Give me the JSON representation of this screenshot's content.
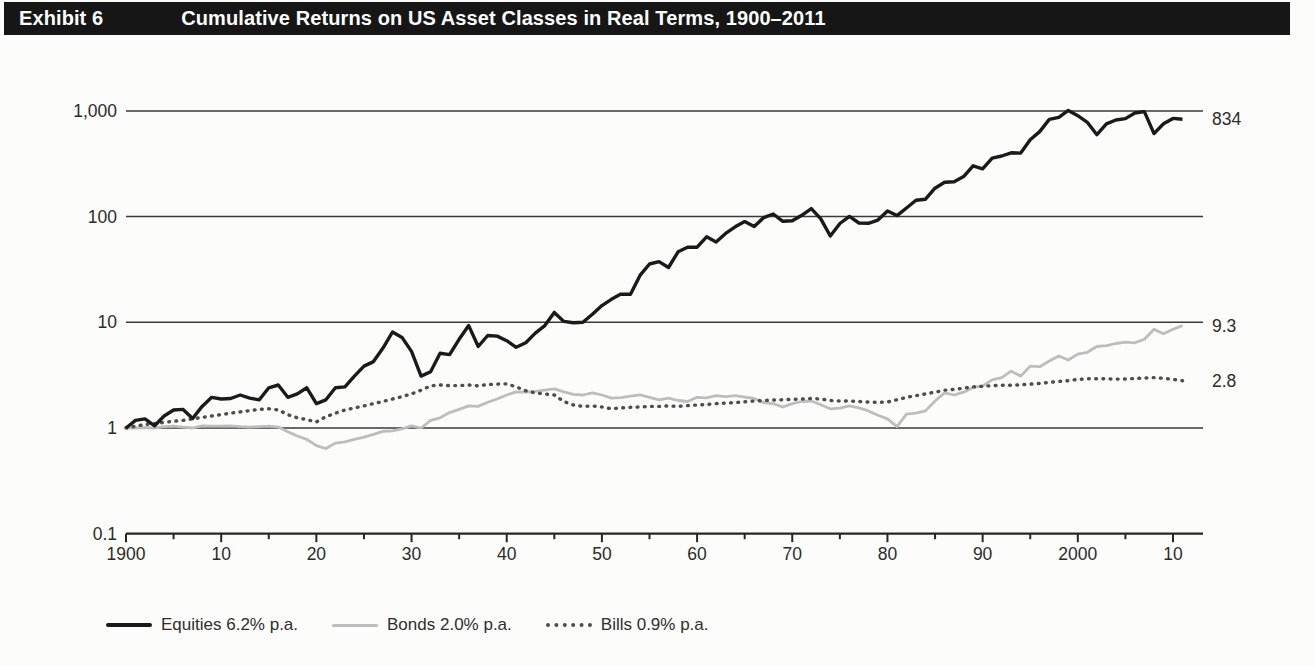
{
  "title_bar": {
    "exhibit": "Exhibit 6",
    "title": "Cumulative Returns on US Asset Classes in Real Terms, 1900–2011"
  },
  "legend": {
    "items": [
      {
        "label": "Equities  6.2% p.a.",
        "swatch": "thick-black-solid-line"
      },
      {
        "label": "Bonds 2.0% p.a.",
        "swatch": "light-gray-solid-line"
      },
      {
        "label": "Bills 0.9% p.a.",
        "swatch": "dark-gray-dotted-line"
      }
    ]
  },
  "chart_data": {
    "type": "line",
    "title": "Cumulative Returns on US Asset Classes in Real Terms, 1900–2011",
    "y_scale": "log",
    "xlim": [
      1900,
      2011
    ],
    "ylim": [
      0.1,
      1000
    ],
    "grid": "horizontal-only",
    "legend_position": "bottom-left",
    "x_start_year": 1900,
    "x_tick_years": [
      1900,
      1910,
      1920,
      1930,
      1940,
      1950,
      1960,
      1970,
      1980,
      1990,
      2000,
      2010
    ],
    "x_tick_labels": [
      "1900",
      "10",
      "20",
      "30",
      "40",
      "50",
      "60",
      "70",
      "80",
      "90",
      "2000",
      "10"
    ],
    "x_minor_tick_step": 5,
    "y_tick_values": [
      0.1,
      1,
      10,
      100,
      1000
    ],
    "y_tick_labels": [
      "0.1",
      "1",
      "10",
      "100",
      "1,000"
    ],
    "gridline_values": [
      1,
      10,
      100,
      1000
    ],
    "series": [
      {
        "name": "Equities",
        "label": "Equities  6.2% p.a.",
        "annual_return": "6.2% p.a.",
        "end_label": "834",
        "end_value": 834,
        "color": "#1a1a1a",
        "style": "solid-thick",
        "values": [
          1.0,
          1.18,
          1.22,
          1.05,
          1.3,
          1.48,
          1.5,
          1.23,
          1.6,
          1.95,
          1.88,
          1.9,
          2.05,
          1.92,
          1.85,
          2.4,
          2.55,
          1.95,
          2.1,
          2.4,
          1.7,
          1.85,
          2.4,
          2.45,
          3.1,
          3.85,
          4.25,
          5.7,
          8.1,
          7.2,
          5.3,
          3.1,
          3.4,
          5.1,
          4.95,
          6.9,
          9.3,
          5.9,
          7.5,
          7.4,
          6.7,
          5.8,
          6.4,
          7.9,
          9.3,
          12.4,
          10.2,
          9.9,
          10.0,
          11.9,
          14.4,
          16.5,
          18.5,
          18.4,
          27.8,
          35.6,
          37.5,
          33.0,
          46.4,
          51.2,
          51.4,
          64.4,
          57.6,
          69.4,
          80.1,
          89.6,
          80.5,
          97.8,
          105.8,
          90.2,
          91.3,
          102.8,
          119.0,
          95.1,
          65.5,
          86.1,
          100.4,
          86.9,
          86.5,
          92.6,
          113.2,
          102.1,
          120.7,
          142.6,
          146.2,
          185.6,
          211.1,
          213.7,
          239.2,
          302.7,
          283.1,
          357.9,
          374.5,
          401.7,
          399.1,
          533.9,
          637.7,
          830.6,
          870.0,
          1010.0,
          900.0,
          780.0,
          595.0,
          755.0,
          820.0,
          845.0,
          955.0,
          985.0,
          610.0,
          755.0,
          850.0,
          834.0
        ]
      },
      {
        "name": "Bonds",
        "label": "Bonds 2.0% p.a.",
        "annual_return": "2.0% p.a.",
        "end_label": "9.3",
        "end_value": 9.3,
        "color": "#bdbdbd",
        "style": "solid",
        "values": [
          1.0,
          1.0,
          1.01,
          1.0,
          1.03,
          1.04,
          1.02,
          1.0,
          1.05,
          1.04,
          1.04,
          1.05,
          1.03,
          1.02,
          1.03,
          1.04,
          1.02,
          0.92,
          0.84,
          0.78,
          0.68,
          0.64,
          0.72,
          0.74,
          0.78,
          0.82,
          0.87,
          0.93,
          0.94,
          0.98,
          1.05,
          1.0,
          1.18,
          1.25,
          1.4,
          1.5,
          1.62,
          1.6,
          1.75,
          1.88,
          2.05,
          2.2,
          2.18,
          2.22,
          2.28,
          2.35,
          2.2,
          2.08,
          2.05,
          2.15,
          2.05,
          1.92,
          1.94,
          2.0,
          2.06,
          1.95,
          1.85,
          1.92,
          1.82,
          1.78,
          1.95,
          1.93,
          2.02,
          1.98,
          2.02,
          1.96,
          1.9,
          1.74,
          1.7,
          1.58,
          1.7,
          1.78,
          1.8,
          1.66,
          1.52,
          1.54,
          1.62,
          1.55,
          1.45,
          1.32,
          1.22,
          1.03,
          1.35,
          1.38,
          1.45,
          1.8,
          2.15,
          2.05,
          2.18,
          2.42,
          2.5,
          2.85,
          3.0,
          3.45,
          3.1,
          3.85,
          3.8,
          4.3,
          4.8,
          4.4,
          5.0,
          5.2,
          5.9,
          6.0,
          6.3,
          6.5,
          6.4,
          6.9,
          8.6,
          7.8,
          8.6,
          9.3
        ]
      },
      {
        "name": "Bills",
        "label": "Bills 0.9% p.a.",
        "annual_return": "0.9% p.a.",
        "end_label": "2.8",
        "end_value": 2.8,
        "color": "#4d4d4d",
        "style": "dotted",
        "values": [
          1.0,
          1.04,
          1.08,
          1.1,
          1.13,
          1.16,
          1.18,
          1.22,
          1.26,
          1.3,
          1.34,
          1.38,
          1.42,
          1.46,
          1.5,
          1.52,
          1.48,
          1.34,
          1.25,
          1.2,
          1.14,
          1.28,
          1.38,
          1.48,
          1.55,
          1.62,
          1.7,
          1.78,
          1.88,
          1.98,
          2.1,
          2.28,
          2.5,
          2.55,
          2.52,
          2.52,
          2.55,
          2.5,
          2.58,
          2.6,
          2.62,
          2.45,
          2.25,
          2.15,
          2.1,
          2.05,
          1.78,
          1.65,
          1.6,
          1.62,
          1.58,
          1.52,
          1.55,
          1.57,
          1.58,
          1.6,
          1.6,
          1.62,
          1.6,
          1.63,
          1.65,
          1.67,
          1.7,
          1.72,
          1.74,
          1.77,
          1.8,
          1.82,
          1.84,
          1.85,
          1.87,
          1.88,
          1.9,
          1.88,
          1.82,
          1.8,
          1.8,
          1.78,
          1.76,
          1.75,
          1.76,
          1.85,
          1.95,
          2.02,
          2.1,
          2.18,
          2.28,
          2.32,
          2.38,
          2.45,
          2.48,
          2.52,
          2.54,
          2.54,
          2.56,
          2.6,
          2.64,
          2.7,
          2.76,
          2.8,
          2.88,
          2.92,
          2.93,
          2.92,
          2.9,
          2.91,
          2.94,
          2.97,
          3.0,
          2.95,
          2.88,
          2.8
        ]
      }
    ]
  }
}
